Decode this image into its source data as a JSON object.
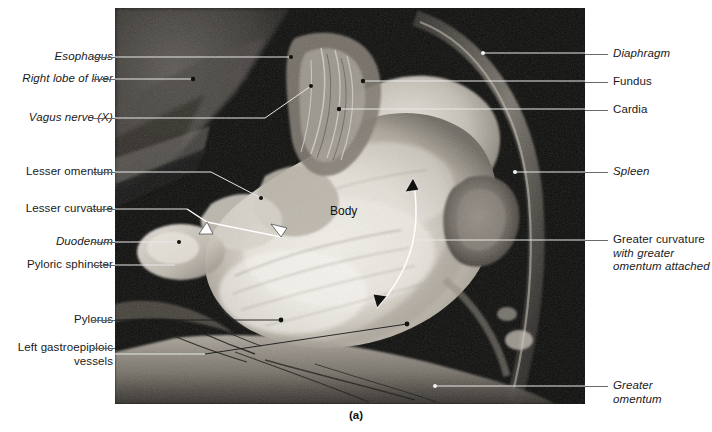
{
  "figure": {
    "caption": "(a)",
    "photo_alt_name": "cadaver-dissection-stomach",
    "in_photo_labels": [
      {
        "text": "Body",
        "x": 330,
        "y": 204
      }
    ]
  },
  "left_labels": [
    {
      "text": "Esophagus",
      "italic": true,
      "y": 57,
      "leader_y": 57,
      "leader_x1": 128,
      "leader_x2": 115
    },
    {
      "text": "Right lobe of liver",
      "italic": true,
      "y": 79,
      "leader_y": 79,
      "leader_x1": 128,
      "leader_x2": 115
    },
    {
      "text": "Vagus nerve (X)",
      "italic": true,
      "y": 118,
      "leader_y": 118,
      "leader_x1": 128,
      "leader_x2": 115
    },
    {
      "text": "Lesser omentum",
      "italic": false,
      "y": 172,
      "leader_y": 172,
      "leader_x1": 128,
      "leader_x2": 115
    },
    {
      "text": "Lesser curvature",
      "italic": false,
      "y": 209,
      "leader_y": 209,
      "leader_x1": 128,
      "leader_x2": 115
    },
    {
      "text": "Duodenum",
      "italic": true,
      "y": 242,
      "leader_y": 242,
      "leader_x1": 128,
      "leader_x2": 115
    },
    {
      "text": "Pyloric sphincter",
      "italic": false,
      "y": 265,
      "leader_y": 265,
      "leader_x1": 128,
      "leader_x2": 115
    },
    {
      "text": "Pylorus",
      "italic": false,
      "y": 320,
      "leader_y": 320,
      "leader_x1": 128,
      "leader_x2": 115
    },
    {
      "text": "Left gastroepiploic\nvessels",
      "italic": false,
      "y": 348,
      "leader_y": 354,
      "leader_x1": 128,
      "leader_x2": 115
    }
  ],
  "right_labels": [
    {
      "text": "Diaphragm",
      "italic": true,
      "sub": "",
      "y": 54,
      "leader_y": 54
    },
    {
      "text": "Fundus",
      "italic": false,
      "sub": "",
      "y": 82,
      "leader_y": 82
    },
    {
      "text": "Cardia",
      "italic": false,
      "sub": "",
      "y": 110,
      "leader_y": 110
    },
    {
      "text": "Spleen",
      "italic": true,
      "sub": "",
      "y": 172,
      "leader_y": 172
    },
    {
      "text": "Greater curvature",
      "italic": false,
      "sub": "with greater\nomentum attached",
      "y": 240,
      "leader_y": 240
    },
    {
      "text": "Greater\nomentum",
      "italic": true,
      "sub": "",
      "y": 386,
      "leader_y": 386
    }
  ],
  "colors": {
    "page_background": "#ffffff",
    "leader_outside": "#6a6a6a",
    "leader_inside_light": "#e8e8e8",
    "leader_inside_dark": "#101010",
    "text": "#1a1a1a"
  }
}
